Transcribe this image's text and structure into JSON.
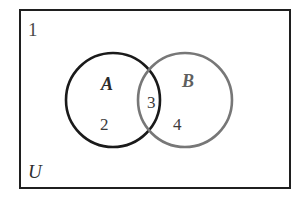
{
  "figure": {
    "type": "venn-diagram",
    "background_color": "#ffffff",
    "width": 306,
    "height": 203
  },
  "universe": {
    "box": {
      "x": 20,
      "y": 10,
      "width": 270,
      "height": 178,
      "stroke_color": "#1f1f1f",
      "stroke_width": 2.2,
      "fill_color": "#ffffff"
    },
    "corner_number_label": "1",
    "symbol_label": "U"
  },
  "sets": [
    {
      "id": "set-a",
      "label": "A",
      "cx": 113,
      "cy": 100,
      "r": 47,
      "stroke_color": "#1a1a1a",
      "stroke_width": 2.6
    },
    {
      "id": "set-b",
      "label": "B",
      "cx": 185,
      "cy": 100,
      "r": 47,
      "stroke_color": "#777777",
      "stroke_width": 2.6
    }
  ],
  "regions": {
    "a_only": "2",
    "intersection": "3",
    "b_only": "4"
  },
  "chart_data": {
    "type": "venn",
    "title": "",
    "set_labels": [
      "A",
      "B"
    ],
    "universe_label": "U",
    "universe_outside_value": 1,
    "regions": [
      {
        "name": "A only",
        "label": "2",
        "value": 2
      },
      {
        "name": "A ∩ B",
        "label": "3",
        "value": 3
      },
      {
        "name": "B only",
        "label": "4",
        "value": 4
      }
    ],
    "annotations": [
      {
        "text": "1",
        "position": "top-left-outside-circles-inside-universe"
      },
      {
        "text": "U",
        "position": "bottom-left-inside-universe"
      }
    ],
    "legend": "none",
    "grid": false
  }
}
